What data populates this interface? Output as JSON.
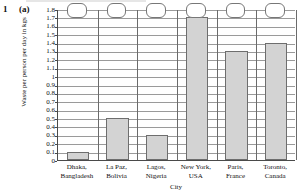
{
  "question": {
    "number": "1",
    "part": "(a)"
  },
  "chart_data": {
    "type": "bar",
    "title": "",
    "xlabel": "City",
    "ylabel": "Waste per person per day in kgs",
    "categories": [
      "Dhaka, Bangladesh",
      "La Paz, Bolivia",
      "Lagos, Nigeria",
      "New York, USA",
      "Paris, France",
      "Toronto, Canada"
    ],
    "category_lines": [
      [
        "Dhaka,",
        "Bangladesh"
      ],
      [
        "La Paz,",
        "Bolivia"
      ],
      [
        "Lagos,",
        "Nigeria"
      ],
      [
        "New York,",
        "USA"
      ],
      [
        "Paris,",
        "France"
      ],
      [
        "Toronto,",
        "Canada"
      ]
    ],
    "values": [
      0.1,
      0.5,
      0.3,
      1.7,
      1.3,
      1.4
    ],
    "ylim": [
      0,
      1.8
    ],
    "ytick_step": 0.1,
    "ytick_labels": [
      "1.8",
      "1.7",
      "1.6",
      "1.5",
      "1.4",
      "1.3",
      "1.2",
      "1.1",
      "1",
      "0.9",
      "0.8",
      "0.7",
      "0.6",
      "0.5",
      "0.4",
      "0.3",
      "0.2",
      "0.1",
      "0"
    ],
    "grid": "horizontal-and-vertical",
    "legend": "none",
    "bar_fill": "#d3d3d3",
    "bar_edge": "#6e6e6e",
    "grid_color": "#9a9a9a",
    "axis_color": "#4a4a4a"
  },
  "answer_boxes": [
    {
      "label": ""
    },
    {
      "label": ""
    },
    {
      "label": ""
    },
    {
      "label": ""
    },
    {
      "label": ""
    },
    {
      "label": ""
    }
  ]
}
